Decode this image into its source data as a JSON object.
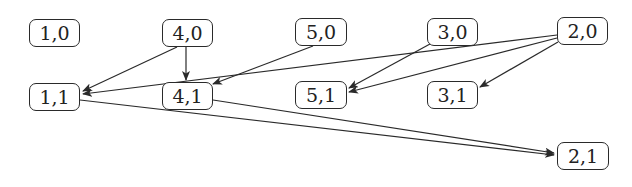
{
  "diagram": {
    "type": "directed-graph",
    "colors": {
      "node_border": "#2a2a2a",
      "edge": "#2a2a2a",
      "background": "#ffffff",
      "text": "#222222"
    },
    "nodes": [
      {
        "id": "n10",
        "label": "1,0",
        "x": 29,
        "y": 19,
        "w": 51,
        "h": 28
      },
      {
        "id": "n40",
        "label": "4,0",
        "x": 162,
        "y": 19,
        "w": 51,
        "h": 28
      },
      {
        "id": "n50",
        "label": "5,0",
        "x": 295,
        "y": 18,
        "w": 52,
        "h": 28
      },
      {
        "id": "n30",
        "label": "3,0",
        "x": 427,
        "y": 18,
        "w": 51,
        "h": 28
      },
      {
        "id": "n20",
        "label": "2,0",
        "x": 557,
        "y": 17,
        "w": 51,
        "h": 28
      },
      {
        "id": "n11",
        "label": "1,1",
        "x": 29,
        "y": 83,
        "w": 51,
        "h": 28
      },
      {
        "id": "n41",
        "label": "4,1",
        "x": 162,
        "y": 82,
        "w": 51,
        "h": 28
      },
      {
        "id": "n51",
        "label": "5,1",
        "x": 295,
        "y": 81,
        "w": 52,
        "h": 28
      },
      {
        "id": "n31",
        "label": "3,1",
        "x": 427,
        "y": 81,
        "w": 51,
        "h": 28
      },
      {
        "id": "n21",
        "label": "2,1",
        "x": 557,
        "y": 142,
        "w": 52,
        "h": 28
      }
    ],
    "edges": [
      {
        "from": "4,0",
        "to": "1,1",
        "x1": 177,
        "y1": 47,
        "x2": 83,
        "y2": 91
      },
      {
        "from": "4,0",
        "to": "4,1",
        "x1": 186,
        "y1": 47,
        "x2": 186,
        "y2": 80
      },
      {
        "from": "5,0",
        "to": "4,1",
        "x1": 313,
        "y1": 46,
        "x2": 213,
        "y2": 84
      },
      {
        "from": "2,0",
        "to": "1,1",
        "x1": 557,
        "y1": 35,
        "x2": 83,
        "y2": 94
      },
      {
        "from": "3,0",
        "to": "5,1",
        "x1": 430,
        "y1": 44,
        "x2": 349,
        "y2": 88
      },
      {
        "from": "2,0",
        "to": "5,1",
        "x1": 557,
        "y1": 38,
        "x2": 349,
        "y2": 92
      },
      {
        "from": "2,0",
        "to": "3,1",
        "x1": 558,
        "y1": 42,
        "x2": 480,
        "y2": 87
      },
      {
        "from": "1,1",
        "to": "2,1",
        "x1": 80,
        "y1": 100,
        "x2": 554,
        "y2": 155
      },
      {
        "from": "4,1",
        "to": "2,1",
        "x1": 213,
        "y1": 100,
        "x2": 554,
        "y2": 153
      }
    ]
  }
}
